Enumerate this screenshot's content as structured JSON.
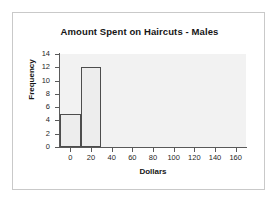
{
  "chart_data": {
    "type": "bar",
    "title": "Amount Spent on Haircuts - Males",
    "xlabel": "Dollars",
    "ylabel": "Frequency",
    "xlim": [
      -10,
      170
    ],
    "ylim": [
      0,
      14
    ],
    "xticks": [
      0,
      20,
      40,
      60,
      80,
      100,
      120,
      140,
      160
    ],
    "yticks": [
      0,
      2,
      4,
      6,
      8,
      10,
      12,
      14
    ],
    "xtick_labels": [
      "0",
      "20",
      "40",
      "60",
      "80",
      "100",
      "120",
      "140",
      "160"
    ],
    "ytick_labels": [
      "0",
      "2",
      "4",
      "6",
      "8",
      "10",
      "12",
      "14"
    ],
    "grid": false,
    "legend": "none",
    "bin_width": 20,
    "bins": [
      {
        "label": "-10 to 10",
        "x_start": -10,
        "x_end": 10,
        "value": 5
      },
      {
        "label": "10 to 30",
        "x_start": 10,
        "x_end": 30,
        "value": 12
      }
    ],
    "categories": [
      "-10 to 10",
      "10 to 30"
    ],
    "values": [
      5,
      12
    ],
    "colors": {
      "bar_fill": "#ededed",
      "bar_border": "#4d4d4d",
      "plot_background": "#f2f2f2",
      "axis": "#5a5a5a",
      "text": "#161616",
      "frame_border": "#c9c9c9",
      "page_background": "#ffffff"
    }
  }
}
